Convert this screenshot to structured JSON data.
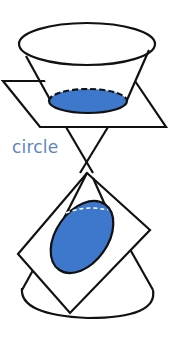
{
  "diagram": {
    "label": "circle",
    "colors": {
      "fill": "#3d78cc",
      "stroke": "#111111",
      "label": "#5a86c0"
    }
  }
}
